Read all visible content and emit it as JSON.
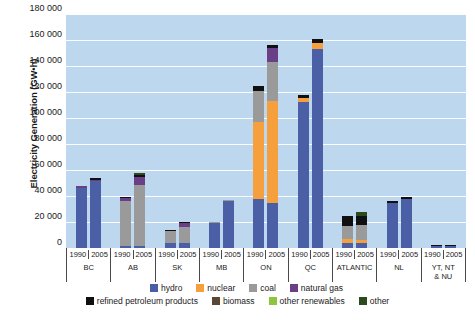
{
  "axes": {
    "ylabel": "Electricity Generation (GW•h)",
    "yticks": [
      "180 000",
      "160 000",
      "140 000",
      "120 000",
      "100 000",
      "80 000",
      "60 000",
      "40 000",
      "20 000",
      "0"
    ]
  },
  "legend": {
    "row1": [
      {
        "label": "hydro",
        "color": "#4a5fa5"
      },
      {
        "label": "nuclear",
        "color": "#f5a03c"
      },
      {
        "label": "coal",
        "color": "#9a9a9a"
      },
      {
        "label": "natural gas",
        "color": "#6b3f86"
      }
    ],
    "row2": [
      {
        "label": "refined petroleum products",
        "color": "#101010"
      },
      {
        "label": "biomass",
        "color": "#5a4636"
      },
      {
        "label": "other renewables",
        "color": "#8cc63f"
      },
      {
        "label": "other",
        "color": "#2d4a1e"
      }
    ]
  },
  "chart_data": {
    "type": "bar",
    "title": "",
    "xlabel": "",
    "ylabel": "Electricity Generation (GW•h)",
    "ylim": [
      0,
      180000
    ],
    "ytick_step": 20000,
    "grid": true,
    "stacked": true,
    "legend_position": "bottom",
    "series_order": [
      "hydro",
      "nuclear",
      "coal",
      "natural gas",
      "refined petroleum products",
      "biomass",
      "other renewables",
      "other"
    ],
    "series_colors": {
      "hydro": "#4a5fa5",
      "nuclear": "#f5a03c",
      "coal": "#9a9a9a",
      "natural gas": "#6b3f86",
      "refined petroleum products": "#101010",
      "biomass": "#5a4636",
      "other renewables": "#8cc63f",
      "other": "#2d4a1e"
    },
    "groups": [
      {
        "name": "BC",
        "bars": [
          {
            "year": "1990",
            "total": 48000,
            "segments": [
              {
                "series": "hydro",
                "value": 46500
              },
              {
                "series": "natural gas",
                "value": 900
              },
              {
                "series": "refined petroleum products",
                "value": 600
              }
            ]
          },
          {
            "year": "2005",
            "total": 53500,
            "segments": [
              {
                "series": "hydro",
                "value": 51500
              },
              {
                "series": "natural gas",
                "value": 1200
              },
              {
                "series": "refined petroleum products",
                "value": 800
              }
            ]
          }
        ]
      },
      {
        "name": "AB",
        "bars": [
          {
            "year": "1990",
            "total": 39000,
            "segments": [
              {
                "series": "hydro",
                "value": 1800
              },
              {
                "series": "coal",
                "value": 34500
              },
              {
                "series": "natural gas",
                "value": 2000
              },
              {
                "series": "refined petroleum products",
                "value": 700
              }
            ]
          },
          {
            "year": "2005",
            "total": 57500,
            "segments": [
              {
                "series": "hydro",
                "value": 1900
              },
              {
                "series": "coal",
                "value": 46500
              },
              {
                "series": "natural gas",
                "value": 6500
              },
              {
                "series": "refined petroleum products",
                "value": 1600
              },
              {
                "series": "other",
                "value": 1000
              }
            ]
          }
        ]
      },
      {
        "name": "SK",
        "bars": [
          {
            "year": "1990",
            "total": 13500,
            "segments": [
              {
                "series": "hydro",
                "value": 3500
              },
              {
                "series": "coal",
                "value": 9500
              },
              {
                "series": "refined petroleum products",
                "value": 500
              }
            ]
          },
          {
            "year": "2005",
            "total": 19800,
            "segments": [
              {
                "series": "hydro",
                "value": 4000
              },
              {
                "series": "coal",
                "value": 12500
              },
              {
                "series": "natural gas",
                "value": 3000
              },
              {
                "series": "refined petroleum products",
                "value": 300
              }
            ]
          }
        ]
      },
      {
        "name": "MB",
        "bars": [
          {
            "year": "1990",
            "total": 20000,
            "segments": [
              {
                "series": "hydro",
                "value": 19500
              },
              {
                "series": "coal",
                "value": 500
              }
            ]
          },
          {
            "year": "2005",
            "total": 37000,
            "segments": [
              {
                "series": "hydro",
                "value": 36200
              },
              {
                "series": "coal",
                "value": 500
              },
              {
                "series": "refined petroleum products",
                "value": 300
              }
            ]
          }
        ]
      },
      {
        "name": "ON",
        "bars": [
          {
            "year": "1990",
            "total": 125000,
            "segments": [
              {
                "series": "hydro",
                "value": 38000
              },
              {
                "series": "nuclear",
                "value": 59000
              },
              {
                "series": "coal",
                "value": 24000
              },
              {
                "series": "refined petroleum products",
                "value": 4000
              }
            ]
          },
          {
            "year": "2005",
            "total": 156000,
            "segments": [
              {
                "series": "hydro",
                "value": 35000
              },
              {
                "series": "nuclear",
                "value": 78000
              },
              {
                "series": "coal",
                "value": 30000
              },
              {
                "series": "natural gas",
                "value": 11000
              },
              {
                "series": "refined petroleum products",
                "value": 2000
              }
            ]
          }
        ]
      },
      {
        "name": "QC",
        "bars": [
          {
            "year": "1990",
            "total": 118000,
            "segments": [
              {
                "series": "hydro",
                "value": 112000
              },
              {
                "series": "nuclear",
                "value": 3500
              },
              {
                "series": "refined petroleum products",
                "value": 2500
              }
            ]
          },
          {
            "year": "2005",
            "total": 161000,
            "segments": [
              {
                "series": "hydro",
                "value": 153000
              },
              {
                "series": "nuclear",
                "value": 4500
              },
              {
                "series": "refined petroleum products",
                "value": 3500
              }
            ]
          }
        ]
      },
      {
        "name": "ATLANTIC",
        "bars": [
          {
            "year": "1990",
            "total": 24500,
            "segments": [
              {
                "series": "hydro",
                "value": 4000
              },
              {
                "series": "nuclear",
                "value": 3000
              },
              {
                "series": "coal",
                "value": 10000
              },
              {
                "series": "refined petroleum products",
                "value": 7500
              }
            ]
          },
          {
            "year": "2005",
            "total": 28000,
            "segments": [
              {
                "series": "hydro",
                "value": 3500
              },
              {
                "series": "nuclear",
                "value": 3000
              },
              {
                "series": "coal",
                "value": 11000
              },
              {
                "series": "refined petroleum products",
                "value": 7000
              },
              {
                "series": "other",
                "value": 3500
              }
            ]
          }
        ]
      },
      {
        "name": "NL",
        "bars": [
          {
            "year": "1990",
            "total": 36500,
            "segments": [
              {
                "series": "hydro",
                "value": 35000
              },
              {
                "series": "refined petroleum products",
                "value": 1500
              }
            ]
          },
          {
            "year": "2005",
            "total": 39500,
            "segments": [
              {
                "series": "hydro",
                "value": 37500
              },
              {
                "series": "refined petroleum products",
                "value": 2000
              }
            ]
          }
        ]
      },
      {
        "name": "YT, NT\n& NU",
        "bars": [
          {
            "year": "1990",
            "total": 2000,
            "segments": [
              {
                "series": "hydro",
                "value": 1400
              },
              {
                "series": "refined petroleum products",
                "value": 600
              }
            ]
          },
          {
            "year": "2005",
            "total": 2200,
            "segments": [
              {
                "series": "hydro",
                "value": 1500
              },
              {
                "series": "refined petroleum products",
                "value": 700
              }
            ]
          }
        ]
      }
    ]
  }
}
